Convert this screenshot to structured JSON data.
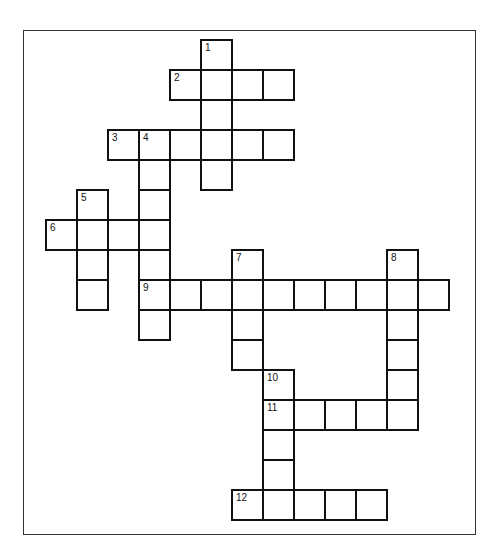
{
  "puzzle": {
    "type": "crossword",
    "cell_size": [
      31,
      30
    ],
    "origin": [
      46,
      40
    ],
    "frame": {
      "left": 23,
      "top": 30,
      "right": 476,
      "bottom": 535
    },
    "colors": {
      "border": "#111111",
      "background": "#ffffff"
    },
    "entries": [
      {
        "number": "1",
        "direction": "down",
        "row": 0,
        "col": 5,
        "length": 5
      },
      {
        "number": "2",
        "direction": "across",
        "row": 1,
        "col": 4,
        "length": 4
      },
      {
        "number": "3",
        "direction": "across",
        "row": 3,
        "col": 2,
        "length": 6
      },
      {
        "number": "4",
        "direction": "down",
        "row": 3,
        "col": 3,
        "length": 7
      },
      {
        "number": "5",
        "direction": "down",
        "row": 5,
        "col": 1,
        "length": 4
      },
      {
        "number": "6",
        "direction": "across",
        "row": 6,
        "col": 0,
        "length": 4
      },
      {
        "number": "7",
        "direction": "down",
        "row": 7,
        "col": 6,
        "length": 4
      },
      {
        "number": "8",
        "direction": "down",
        "row": 7,
        "col": 11,
        "length": 6
      },
      {
        "number": "9",
        "direction": "across",
        "row": 8,
        "col": 3,
        "length": 10
      },
      {
        "number": "10",
        "direction": "down",
        "row": 11,
        "col": 7,
        "length": 5
      },
      {
        "number": "11",
        "direction": "across",
        "row": 12,
        "col": 7,
        "length": 5
      },
      {
        "number": "12",
        "direction": "across",
        "row": 15,
        "col": 6,
        "length": 5
      }
    ]
  }
}
